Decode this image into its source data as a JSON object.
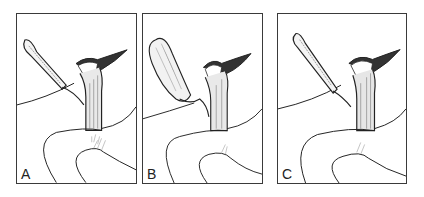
{
  "figure": {
    "type": "medical illustration",
    "panels": [
      {
        "label": "A",
        "description": "thin gallbladder with cystic duct joining common bile duct"
      },
      {
        "label": "B",
        "description": "distended gallbladder with cystic duct"
      },
      {
        "label": "C",
        "description": "thin gallbladder with ductal variant"
      }
    ]
  }
}
